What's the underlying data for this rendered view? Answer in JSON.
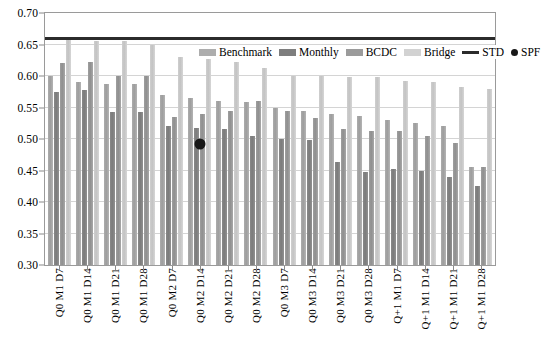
{
  "chart_data": {
    "type": "bar",
    "title": "",
    "subtitle": "",
    "xlabel": "",
    "ylabel": "",
    "ylim": [
      0.3,
      0.7
    ],
    "ytick_step": 0.05,
    "ytick_labels": [
      "0.70",
      "0.65",
      "0.60",
      "0.55",
      "0.50",
      "0.45",
      "0.40",
      "0.35",
      "0.30"
    ],
    "ytick_values": [
      0.7,
      0.65,
      0.6,
      0.55,
      0.5,
      0.45,
      0.4,
      0.35,
      0.3
    ],
    "grid": true,
    "legend_position": "top-right-inside",
    "categories": [
      "Q0 M1 D7",
      "Q0 M1 D14",
      "Q0 M1 D21",
      "Q0 M1 D28",
      "Q0 M2 D7",
      "Q0 M2 D14",
      "Q0 M2 D21",
      "Q0 M2 D28",
      "Q0 M3 D7",
      "Q0 M3 D14",
      "Q0 M3 D21",
      "Q0 M3 D28",
      "Q+1 M1 D7",
      "Q+1 M1 D14",
      "Q+1 M1 D21",
      "Q+1 M1 D28"
    ],
    "series": [
      {
        "name": "Benchmark",
        "color": "#adadad",
        "values": [
          0.6,
          0.59,
          0.588,
          0.588,
          0.57,
          0.565,
          0.56,
          0.558,
          0.55,
          0.545,
          0.54,
          0.536,
          0.53,
          0.525,
          0.52,
          0.455
        ]
      },
      {
        "name": "Monthly",
        "color": "#7e7e7e",
        "values": [
          0.575,
          0.578,
          0.543,
          0.543,
          0.52,
          0.518,
          0.516,
          0.504,
          0.5,
          0.498,
          0.464,
          0.448,
          0.452,
          0.45,
          0.44,
          0.425
        ]
      },
      {
        "name": "BCDC",
        "color": "#9b9b9b",
        "values": [
          0.62,
          0.622,
          0.6,
          0.6,
          0.535,
          0.54,
          0.545,
          0.56,
          0.545,
          0.533,
          0.516,
          0.513,
          0.512,
          0.505,
          0.493,
          0.455
        ]
      },
      {
        "name": "Bridge",
        "color": "#d2d2d2",
        "values": [
          0.66,
          0.655,
          0.655,
          0.65,
          0.63,
          0.645,
          0.622,
          0.613,
          0.6,
          0.6,
          0.598,
          0.598,
          0.592,
          0.59,
          0.582,
          0.58
        ]
      }
    ],
    "reference_line": {
      "name": "STD",
      "value": 0.66,
      "color": "#2b2b2b",
      "style": "solid"
    },
    "point_marker": {
      "name": "SPF",
      "category": "Q0 M2 D14",
      "value": 0.492,
      "color": "#181818",
      "shape": "circle"
    },
    "legend": [
      {
        "label": "Benchmark",
        "marker": "bar-swatch"
      },
      {
        "label": "Monthly",
        "marker": "bar-swatch"
      },
      {
        "label": "BCDC",
        "marker": "bar-swatch"
      },
      {
        "label": "Bridge",
        "marker": "bar-swatch"
      },
      {
        "label": "STD",
        "marker": "line"
      },
      {
        "label": "SPF",
        "marker": "dot"
      }
    ]
  }
}
